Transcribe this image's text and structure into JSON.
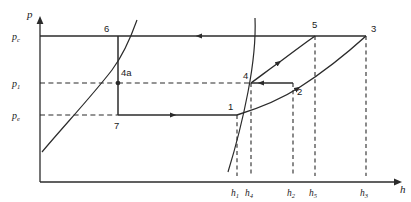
{
  "diagram": {
    "type": "pressure-enthalpy-cycle",
    "axes": {
      "y_axis_label": "p",
      "x_axis_label": "h",
      "y_ticks": [
        {
          "id": "pc",
          "base": "p",
          "sub": "c",
          "y": 36
        },
        {
          "id": "p1",
          "base": "p",
          "sub": "1",
          "y": 83
        },
        {
          "id": "pe",
          "base": "p",
          "sub": "e",
          "y": 115
        }
      ],
      "x_ticks": [
        {
          "id": "h1",
          "base": "h",
          "sub": "1",
          "x": 237
        },
        {
          "id": "h4",
          "base": "h",
          "sub": "4",
          "x": 251
        },
        {
          "id": "h2",
          "base": "h",
          "sub": "2",
          "x": 293
        },
        {
          "id": "h5",
          "base": "h",
          "sub": "5",
          "x": 315
        },
        {
          "id": "h3",
          "base": "h",
          "sub": "3",
          "x": 366
        }
      ]
    },
    "state_points": [
      {
        "id": "6",
        "label": "6",
        "lx": 104,
        "ly": 32,
        "px": 118,
        "py": 36
      },
      {
        "id": "4a",
        "label": "4a",
        "lx": 121,
        "ly": 76,
        "px": 118,
        "py": 83,
        "marker": true
      },
      {
        "id": "7",
        "label": "7",
        "lx": 114,
        "ly": 129,
        "px": 118,
        "py": 115
      },
      {
        "id": "1",
        "label": "1",
        "lx": 228,
        "ly": 110,
        "px": 237,
        "py": 115
      },
      {
        "id": "4",
        "label": "4",
        "lx": 243,
        "ly": 79,
        "px": 251,
        "py": 83
      },
      {
        "id": "2",
        "label": "2",
        "lx": 297,
        "ly": 91,
        "px": 293,
        "py": 83
      },
      {
        "id": "5",
        "label": "5",
        "lx": 312,
        "ly": 26,
        "px": 315,
        "py": 36
      },
      {
        "id": "3",
        "label": "3",
        "lx": 371,
        "ly": 30,
        "px": 366,
        "py": 36
      }
    ],
    "colors": {
      "line": "#2b2b2b",
      "dashed": "#2b2b2b",
      "background": "#ffffff"
    }
  }
}
